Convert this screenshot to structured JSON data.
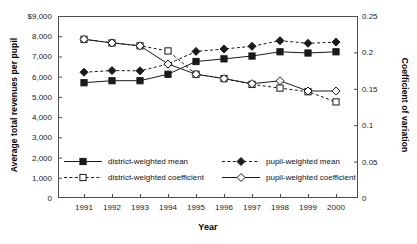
{
  "chart_data": {
    "type": "line",
    "title": "",
    "xlabel": "Year",
    "ylabel": "Average total revenues per pupil",
    "y2label": "Coefficient of variation",
    "categories": [
      "1991",
      "1992",
      "1993",
      "1994",
      "1995",
      "1996",
      "1997",
      "1998",
      "1999",
      "2000"
    ],
    "x": [
      1991,
      1992,
      1993,
      1994,
      1995,
      1996,
      1997,
      1998,
      1999,
      2000
    ],
    "ylim": [
      0,
      9000
    ],
    "y2lim": [
      0,
      0.25
    ],
    "yticks": [
      0,
      1000,
      2000,
      3000,
      4000,
      5000,
      6000,
      7000,
      8000,
      9000
    ],
    "ytick_labels": [
      "0",
      "1,000",
      "2,000",
      "3,000",
      "4,000",
      "5,000",
      "6,000",
      "7,000",
      "8,000",
      "$9,000"
    ],
    "y2ticks": [
      0,
      0.05,
      0.1,
      0.15,
      0.2,
      0.25
    ],
    "y2tick_labels": [
      "0",
      "0.05",
      "0.1",
      "0.15",
      "0.2",
      "0.25"
    ],
    "grid": false,
    "legend_position": "inside-bottom",
    "series": [
      {
        "name": "district-weighted mean",
        "axis": "left",
        "line": "solid",
        "marker": "filled-square",
        "values": [
          5700,
          5800,
          5800,
          6120,
          6750,
          6880,
          7020,
          7230,
          7170,
          7230
        ]
      },
      {
        "name": "pupil-weighted mean",
        "axis": "left",
        "line": "dashed",
        "marker": "filled-diamond",
        "values": [
          6220,
          6300,
          6290,
          6620,
          7250,
          7370,
          7500,
          7780,
          7650,
          7710
        ]
      },
      {
        "name": "district-weighted coefficient",
        "axis": "right",
        "line": "dashed",
        "marker": "open-square",
        "values": [
          0.218,
          0.213,
          0.209,
          0.202,
          0.17,
          0.164,
          0.156,
          0.151,
          0.146,
          0.132
        ]
      },
      {
        "name": "pupil-weighted coefficient",
        "axis": "right",
        "line": "solid",
        "marker": "open-diamond",
        "values": [
          0.218,
          0.213,
          0.209,
          0.184,
          0.17,
          0.164,
          0.157,
          0.161,
          0.147,
          0.147
        ]
      }
    ]
  },
  "colors": {
    "line": "#1a1a1a",
    "axis": "#4d4d4d",
    "background": "#ffffff",
    "text": "#111111"
  }
}
